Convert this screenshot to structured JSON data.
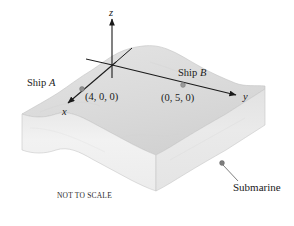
{
  "figure": {
    "note": "NOT TO SCALE",
    "colors": {
      "top_surface": "#dcdcdc",
      "front_left_face": "#efefef",
      "front_right_face": "#e6e6e6",
      "outline": "#b9b9b9",
      "axis": "#1a1a1a",
      "marker": "#8a8a8a",
      "text": "#1a1a1a",
      "background": "#ffffff"
    }
  },
  "axes": [
    {
      "name": "x-axis",
      "label": "x"
    },
    {
      "name": "y-axis",
      "label": "y"
    },
    {
      "name": "z-axis",
      "label": "z"
    }
  ],
  "markers": {
    "ship_a": {
      "label": "Ship A",
      "label_plain": "Ship",
      "label_italic": "A",
      "coordinates": "(4, 0, 0)",
      "icon": "dot-marker"
    },
    "ship_b": {
      "label": "Ship B",
      "label_plain": "Ship",
      "label_italic": "B",
      "coordinates": "(0, 5, 0)",
      "icon": "dot-marker"
    },
    "submarine": {
      "label": "Submarine",
      "icon": "dot-marker"
    }
  }
}
